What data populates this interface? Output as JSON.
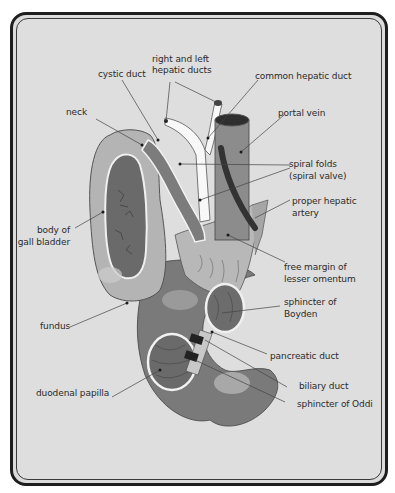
{
  "diagram": {
    "labels": {
      "right_left_hepatic_1": "right and left",
      "right_left_hepatic_2": "hepatic ducts",
      "cystic_duct": "cystic duct",
      "common_hepatic_duct": "common hepatic duct",
      "neck": "neck",
      "portal_vein": "portal vein",
      "spiral_folds_1": "spiral folds",
      "spiral_folds_2": "(spiral valve)",
      "proper_hepatic_artery_1": "proper hepatic",
      "proper_hepatic_artery_2": "artery",
      "body_gall_bladder_1": "body of",
      "body_gall_bladder_2": "gall bladder",
      "free_margin_1": "free margin of",
      "free_margin_2": "lesser omentum",
      "sphincter_boyden_1": "sphincter of",
      "sphincter_boyden_2": "Boyden",
      "fundus": "fundus",
      "pancreatic_duct": "pancreatic duct",
      "duodenal_papilla": "duodenal papilla",
      "biliary_duct": "biliary duct",
      "sphincter_oddi": "sphincter of Oddi"
    },
    "colors": {
      "background": "#dedede",
      "frame": "#1e1e1e",
      "organ_dark": "#6e6e6e",
      "organ_mid": "#8c8c8c",
      "organ_light": "#b4b4b4",
      "duct_white": "#f8f8f8",
      "artery": "#333333",
      "leader_line": "#444444"
    }
  }
}
